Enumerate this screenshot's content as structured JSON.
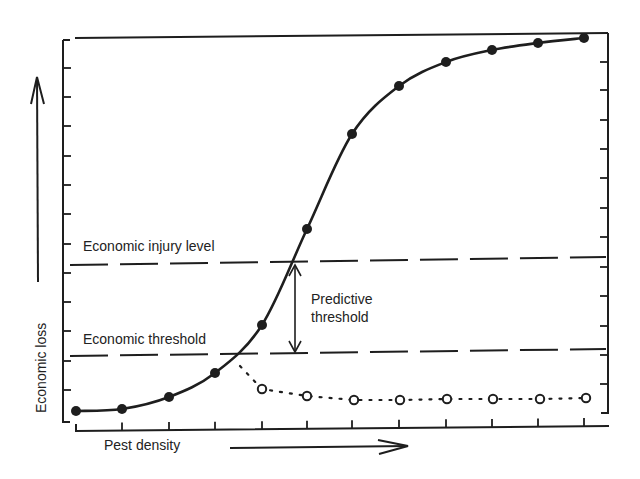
{
  "chart_data": {
    "type": "line",
    "title": "",
    "xlabel": "Pest density",
    "ylabel": "Economic loss",
    "grid": false,
    "x": [
      1,
      2,
      3,
      4,
      5,
      6,
      7,
      8,
      9,
      10,
      11,
      12
    ],
    "series": [
      {
        "name": "Untreated pest population (economic loss)",
        "style": "solid line, filled circles",
        "values": [
          0.4,
          0.5,
          1.0,
          2.2,
          4.4,
          8.7,
          13.0,
          15.2,
          16.3,
          16.8,
          17.1,
          17.3
        ]
      },
      {
        "name": "After control action",
        "style": "dotted line, open circles",
        "x": [
          5,
          6,
          7,
          8,
          9,
          10,
          11,
          12
        ],
        "values": [
          1.4,
          1.1,
          0.9,
          0.9,
          0.9,
          0.9,
          0.9,
          0.9
        ]
      }
    ],
    "reference_lines": [
      {
        "label": "Economic injury level",
        "y": 6.8,
        "style": "dashed"
      },
      {
        "label": "Economic threshold",
        "y": 2.6,
        "style": "dashed"
      }
    ],
    "annotations": [
      {
        "text": "Predictive threshold",
        "type": "double-arrow between Economic threshold and Economic injury level"
      }
    ],
    "axis_ticks": {
      "x_count": 12,
      "y_count": 17,
      "tick_labels": false
    },
    "ylim": [
      0,
      17.5
    ]
  },
  "labels": {
    "eil": "Economic injury level",
    "et": "Economic threshold",
    "predictive_line1": "Predictive",
    "predictive_line2": "threshold",
    "xlabel": "Pest density",
    "ylabel": "Economic loss"
  },
  "geometry": {
    "filled_points": [
      [
        76,
        411
      ],
      [
        122,
        409
      ],
      [
        169,
        397
      ],
      [
        215,
        373
      ],
      [
        262,
        325
      ],
      [
        307,
        229
      ],
      [
        352,
        134
      ],
      [
        399,
        86
      ],
      [
        446,
        62
      ],
      [
        492,
        50
      ],
      [
        538,
        43
      ],
      [
        584,
        38
      ]
    ],
    "open_points": [
      [
        262,
        389
      ],
      [
        307,
        396
      ],
      [
        354,
        400
      ],
      [
        400,
        400
      ],
      [
        447,
        399
      ],
      [
        493,
        399
      ],
      [
        540,
        399
      ],
      [
        586,
        398
      ]
    ]
  },
  "colors": {
    "ink": "#1e1e1e",
    "background": "#ffffff"
  }
}
